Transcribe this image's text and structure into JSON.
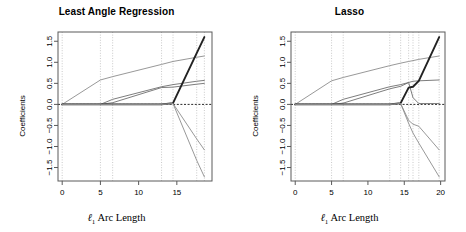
{
  "figure": {
    "width": 466,
    "height": 232,
    "background": "#ffffff",
    "axis_color": "#5a5a5a",
    "grid_color": "#bdbdbd",
    "zero_line_color": "#111111"
  },
  "panels": [
    {
      "key": "lar",
      "title": "Least Angle Regression",
      "xlabel_prefix": "ℓ",
      "xlabel_sub": "1",
      "xlabel_rest": " Arc Length",
      "ylabel": "Coefficients",
      "x_ticks": [
        0,
        5,
        10,
        15
      ],
      "x_tick_labels": [
        "0",
        "5",
        "10",
        "15"
      ],
      "y_ticks": [
        -1.5,
        -1.0,
        -0.5,
        0.0,
        0.5,
        1.0,
        1.5
      ],
      "y_tick_labels": [
        "−1.5",
        "−1.0",
        "−0.5",
        "0.0",
        "0.5",
        "1.0",
        "1.5"
      ],
      "xlim": [
        -0.55,
        19.6
      ],
      "ylim": [
        -1.82,
        1.72
      ],
      "vertical_gridlines": [
        0.0,
        5.0,
        6.6,
        13.0,
        14.5,
        17.6,
        18.6
      ]
    },
    {
      "key": "lasso",
      "title": "Lasso",
      "xlabel_prefix": "ℓ",
      "xlabel_sub": "1",
      "xlabel_rest": " Arc Length",
      "ylabel": "Coefficients",
      "x_ticks": [
        0,
        5,
        10,
        15,
        20
      ],
      "x_tick_labels": [
        "0",
        "5",
        "10",
        "15",
        "20"
      ],
      "y_ticks": [
        -1.5,
        -1.0,
        -0.5,
        0.0,
        0.5,
        1.0,
        1.5
      ],
      "y_tick_labels": [
        "−1.5",
        "−1.0",
        "−0.5",
        "0.0",
        "0.5",
        "1.0",
        "1.5"
      ],
      "xlim": [
        -0.58,
        20.6
      ],
      "ylim": [
        -1.82,
        1.72
      ],
      "vertical_gridlines": [
        0.0,
        5.0,
        6.6,
        13.0,
        14.5,
        15.6,
        16.2,
        17.0,
        19.8
      ]
    }
  ],
  "chart_data": [
    {
      "type": "line",
      "panel": "lar",
      "title": "Least Angle Regression",
      "xlabel": "ℓ1 Arc Length",
      "ylabel": "Coefficients",
      "xlim": [
        -0.55,
        19.6
      ],
      "ylim": [
        -1.82,
        1.72
      ],
      "xticks": [
        0,
        5,
        10,
        15
      ],
      "yticks": [
        -1.5,
        -1.0,
        -0.5,
        0.0,
        0.5,
        1.0,
        1.5
      ],
      "grid": true,
      "grid_orientation": "vertical",
      "zero_reference_line": 0.0,
      "legend": "none",
      "series": [
        {
          "name": "coef-1",
          "color": "#8c8c8c",
          "width": 0.9,
          "x": [
            0.0,
            5.0,
            6.6,
            13.0,
            14.5,
            17.6,
            18.6
          ],
          "y": [
            0.0,
            0.58,
            0.66,
            0.95,
            1.02,
            1.12,
            1.15
          ]
        },
        {
          "name": "coef-2",
          "color": "#6e6e6e",
          "width": 0.9,
          "x": [
            0.0,
            5.0,
            6.6,
            13.0,
            14.5,
            17.6,
            18.6
          ],
          "y": [
            0.0,
            0.0,
            0.12,
            0.42,
            0.47,
            0.55,
            0.57
          ]
        },
        {
          "name": "coef-3",
          "color": "#6e6e6e",
          "width": 0.9,
          "x": [
            0.0,
            5.0,
            6.6,
            13.0,
            14.5,
            17.6,
            18.6
          ],
          "y": [
            0.0,
            0.0,
            0.04,
            0.4,
            0.41,
            0.48,
            0.5
          ]
        },
        {
          "name": "coef-4",
          "color": "#222222",
          "width": 1.9,
          "x": [
            0.0,
            5.0,
            6.6,
            13.0,
            14.5,
            17.6,
            18.6
          ],
          "y": [
            0.0,
            0.0,
            0.0,
            0.0,
            0.03,
            1.22,
            1.6
          ]
        },
        {
          "name": "coef-5",
          "color": "#8c8c8c",
          "width": 0.9,
          "x": [
            0.0,
            5.0,
            6.6,
            13.0,
            14.5,
            17.6,
            18.6
          ],
          "y": [
            0.0,
            0.0,
            0.0,
            0.0,
            0.02,
            -0.82,
            -1.08
          ]
        },
        {
          "name": "coef-6",
          "color": "#8c8c8c",
          "width": 0.9,
          "x": [
            0.0,
            5.0,
            6.6,
            13.0,
            14.5,
            17.6,
            18.6
          ],
          "y": [
            0.0,
            0.0,
            0.0,
            0.0,
            0.02,
            -1.33,
            -1.72
          ]
        }
      ]
    },
    {
      "type": "line",
      "panel": "lasso",
      "title": "Lasso",
      "xlabel": "ℓ1 Arc Length",
      "ylabel": "Coefficients",
      "xlim": [
        -0.58,
        20.6
      ],
      "ylim": [
        -1.82,
        1.72
      ],
      "xticks": [
        0,
        5,
        10,
        15,
        20
      ],
      "yticks": [
        -1.5,
        -1.0,
        -0.5,
        0.0,
        0.5,
        1.0,
        1.5
      ],
      "grid": true,
      "grid_orientation": "vertical",
      "zero_reference_line": 0.0,
      "legend": "none",
      "series": [
        {
          "name": "coef-1",
          "color": "#8c8c8c",
          "width": 0.9,
          "x": [
            0.0,
            5.0,
            6.6,
            13.0,
            14.5,
            15.6,
            16.2,
            17.0,
            19.8
          ],
          "y": [
            0.0,
            0.56,
            0.64,
            0.92,
            0.98,
            1.02,
            1.04,
            1.07,
            1.15
          ]
        },
        {
          "name": "coef-2",
          "color": "#6e6e6e",
          "width": 0.9,
          "x": [
            0.0,
            5.0,
            6.6,
            13.0,
            14.5,
            15.6,
            16.2,
            17.0,
            19.8
          ],
          "y": [
            0.0,
            0.0,
            0.12,
            0.42,
            0.47,
            0.52,
            0.55,
            0.56,
            0.58
          ]
        },
        {
          "name": "coef-3",
          "color": "#6e6e6e",
          "width": 0.9,
          "x": [
            0.0,
            5.0,
            6.6,
            13.0,
            14.5,
            15.6,
            16.2,
            17.0,
            19.8
          ],
          "y": [
            0.0,
            0.0,
            0.03,
            0.37,
            0.43,
            0.52,
            0.16,
            0.02,
            0.02
          ]
        },
        {
          "name": "coef-4",
          "color": "#222222",
          "width": 1.9,
          "x": [
            0.0,
            5.0,
            6.6,
            13.0,
            14.5,
            15.6,
            16.2,
            17.0,
            19.8
          ],
          "y": [
            0.0,
            0.0,
            0.0,
            0.0,
            0.03,
            0.4,
            0.42,
            0.56,
            1.6
          ]
        },
        {
          "name": "coef-5",
          "color": "#8c8c8c",
          "width": 0.9,
          "x": [
            0.0,
            5.0,
            6.6,
            13.0,
            14.5,
            15.6,
            16.2,
            17.0,
            19.8
          ],
          "y": [
            0.0,
            0.0,
            0.0,
            0.0,
            0.02,
            -0.38,
            -0.47,
            -0.52,
            -1.08
          ]
        },
        {
          "name": "coef-6",
          "color": "#8c8c8c",
          "width": 0.9,
          "x": [
            0.0,
            5.0,
            6.6,
            13.0,
            14.5,
            15.6,
            16.2,
            17.0,
            19.8
          ],
          "y": [
            0.0,
            0.0,
            0.0,
            0.0,
            0.02,
            -0.45,
            -0.68,
            -0.92,
            -1.72
          ]
        }
      ]
    }
  ]
}
